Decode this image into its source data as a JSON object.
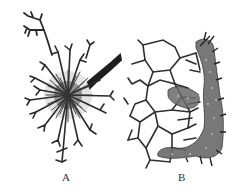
{
  "figure": {
    "panels": [
      {
        "id": "A",
        "label": "A",
        "description": "branching radial hyphal cluster with dark stem"
      },
      {
        "id": "B",
        "label": "B",
        "description": "polygonal cell network with dense stippled mass along edge"
      }
    ],
    "colors": {
      "ink": "#2a2a2a",
      "stipple": "#555555",
      "background": "#ffffff"
    }
  }
}
